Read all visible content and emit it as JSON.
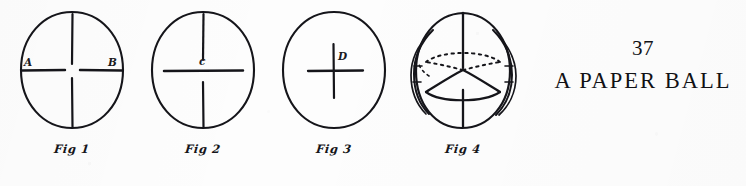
{
  "page": {
    "number": "37",
    "heading": "A PAPER BALL",
    "background_color": "#fdfdfd",
    "ink_color": "#15151a"
  },
  "figures": [
    {
      "id": "fig1",
      "caption": "Fig 1",
      "shape": "circle",
      "description": "circle with four radial slits (top, bottom, left, right) stopping short of the centre",
      "labels": [
        {
          "text": "A",
          "position": "left-slit"
        },
        {
          "text": "B",
          "position": "right-slit"
        }
      ]
    },
    {
      "id": "fig2",
      "caption": "Fig 2",
      "shape": "circle",
      "description": "circle with a top slit, a bottom slit and one long horizontal line across the centre",
      "labels": [
        {
          "text": "c",
          "position": "above-horizontal-line"
        }
      ]
    },
    {
      "id": "fig3",
      "caption": "Fig 3",
      "shape": "circle",
      "description": "circle with a small cross of two short slits at the centre",
      "labels": [
        {
          "text": "D",
          "position": "upper-right-of-cross"
        }
      ]
    },
    {
      "id": "fig4",
      "caption": "Fig 4",
      "shape": "assembled-ball",
      "description": "finished paper ball: sphere formed from interlocking circular discs, with dotted hidden equator lines",
      "labels": []
    }
  ]
}
